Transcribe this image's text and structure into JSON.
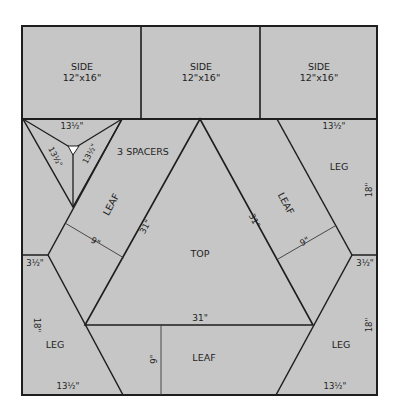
{
  "colors": {
    "background": "#ffffff",
    "panel_fill": "#c6c6c6",
    "line": "#1e1e1e",
    "dimension_line": "#3a3a3a",
    "marker": "#ffffff"
  },
  "panels": {
    "side_left": {
      "name": "SIDE",
      "size": "12\"x16\""
    },
    "side_middle": {
      "name": "SIDE",
      "size": "12\"x16\""
    },
    "side_right": {
      "name": "SIDE",
      "size": "12\"x16\""
    },
    "spacers": {
      "label": "3 SPACERS",
      "top_edge": "13½\"",
      "left_edge": "13½\"",
      "right_edge": "13½\""
    },
    "leaf_left": {
      "name": "LEAF",
      "length": "31\"",
      "width": "9\""
    },
    "leaf_right": {
      "name": "LEAF",
      "length": "31\"",
      "width": "9\""
    },
    "top": {
      "name": "TOP",
      "base": "31\""
    },
    "leaf_bottom": {
      "name": "LEAF",
      "width": "9\""
    },
    "leg_upper_right": {
      "name": "LEG",
      "top": "13½\"",
      "side": "18\""
    },
    "leg_lower_left": {
      "name": "LEG",
      "bottom": "13½\"",
      "side": "18\"",
      "notch": "3½\""
    },
    "leg_lower_right": {
      "name": "LEG",
      "bottom": "13½\"",
      "side": "18\"",
      "notch": "3½\""
    }
  }
}
